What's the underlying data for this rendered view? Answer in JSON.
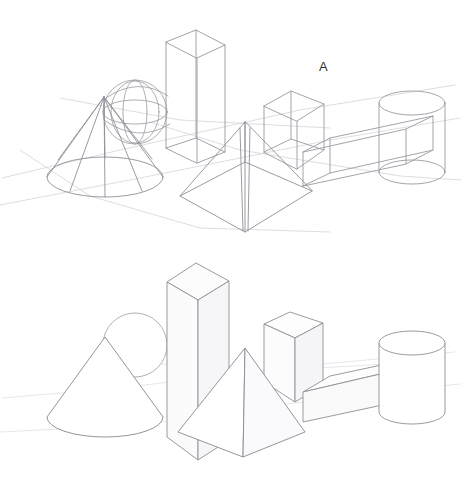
{
  "document": {
    "title": "Geometric Solids Pencil Study",
    "medium": "graphite pencil line drawing on white paper",
    "background_color": "#ffffff",
    "line_color": "#8a8a93",
    "construction_line_color": "#cfcfd6",
    "label_color": "#2e2e30",
    "width": 462,
    "height": 481
  },
  "panels": [
    {
      "id": "panel-a",
      "label": "A",
      "label_position": {
        "x": 319,
        "y": 59
      },
      "style": "transparent wireframe — all hidden edges and construction lines drawn through the forms",
      "shapes": [
        {
          "name": "cone",
          "visible_hidden_edges": true
        },
        {
          "name": "sphere",
          "visible_hidden_edges": true
        },
        {
          "name": "tall-rectangular-prism",
          "visible_hidden_edges": true
        },
        {
          "name": "square-pyramid",
          "visible_hidden_edges": true
        },
        {
          "name": "cube",
          "visible_hidden_edges": true
        },
        {
          "name": "long-rectangular-bar",
          "visible_hidden_edges": true
        },
        {
          "name": "cylinder",
          "visible_hidden_edges": true
        }
      ]
    },
    {
      "id": "panel-b",
      "label": "B",
      "label_position": {
        "x": 320,
        "y": 279
      },
      "style": "opaque solids — only contour and visible edges drawn, forms overlap and occlude",
      "shapes": [
        {
          "name": "cone",
          "visible_hidden_edges": false
        },
        {
          "name": "sphere",
          "visible_hidden_edges": false
        },
        {
          "name": "tall-rectangular-prism",
          "visible_hidden_edges": false
        },
        {
          "name": "square-pyramid",
          "visible_hidden_edges": false
        },
        {
          "name": "cube",
          "visible_hidden_edges": false
        },
        {
          "name": "long-rectangular-bar",
          "visible_hidden_edges": false
        },
        {
          "name": "cylinder",
          "visible_hidden_edges": false
        }
      ]
    }
  ]
}
